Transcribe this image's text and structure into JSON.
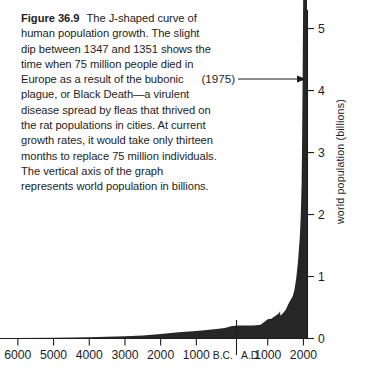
{
  "figure": {
    "number": "Figure 36.9",
    "caption": "The J-shaped curve of human population growth. The slight dip between 1347 and 1351 shows the time when 75 million people died in Europe as a result of the bubonic plague, or Black Death—a virulent disease spread by fleas that thrived on the rat populations in cities. At current growth rates, it would take only thirteen months to replace 75 million individuals. The vertical axis of the graph represents world population in billions."
  },
  "chart_data": {
    "type": "area",
    "title": "",
    "xlabel": "",
    "ylabel": "world population (billions)",
    "grid": false,
    "legend": null,
    "x_axis": {
      "position": "bottom",
      "tick_labels": [
        "6000",
        "5000",
        "4000",
        "3000",
        "2000",
        "1000",
        "1000",
        "2000"
      ],
      "tick_values": [
        -6000,
        -5000,
        -4000,
        -3000,
        -2000,
        -1000,
        1000,
        2000
      ],
      "era_divider": {
        "left_label": "B.C.",
        "right_label": "A.D.",
        "value": 0
      },
      "xlim": [
        -6500,
        2100
      ]
    },
    "y_axis": {
      "position": "right",
      "tick_labels": [
        "0",
        "1",
        "2",
        "3",
        "4",
        "5"
      ],
      "tick_values": [
        0,
        1,
        2,
        3,
        4,
        5
      ],
      "ylim": [
        0,
        5.3
      ]
    },
    "annotations": [
      {
        "label": "(1975)",
        "x": 1975,
        "y": 4,
        "arrow": "right"
      }
    ],
    "series": [
      {
        "name": "world population",
        "units": "billions",
        "x": [
          -6500,
          -6000,
          -5000,
          -4000,
          -3000,
          -2500,
          -2000,
          -1500,
          -1000,
          -500,
          -200,
          0,
          200,
          400,
          600,
          800,
          1000,
          1100,
          1200,
          1300,
          1347,
          1351,
          1400,
          1500,
          1600,
          1700,
          1750,
          1800,
          1850,
          1900,
          1927,
          1950,
          1960,
          1975,
          1987,
          1999,
          2000
        ],
        "values": [
          0.005,
          0.007,
          0.012,
          0.02,
          0.035,
          0.05,
          0.072,
          0.1,
          0.12,
          0.15,
          0.17,
          0.2,
          0.21,
          0.21,
          0.21,
          0.22,
          0.31,
          0.32,
          0.36,
          0.4,
          0.44,
          0.37,
          0.39,
          0.46,
          0.58,
          0.68,
          0.79,
          0.98,
          1.26,
          1.65,
          2.0,
          2.52,
          3.03,
          4.0,
          5.0,
          6.0,
          6.1
        ],
        "color": "#262626"
      }
    ],
    "colors": {
      "curve_fill": "#262626",
      "axis": "#1d1d1d",
      "background": "#ffffff",
      "text": "#1d1d1d"
    }
  }
}
